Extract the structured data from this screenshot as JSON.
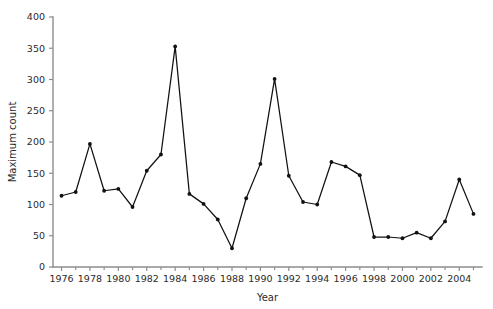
{
  "chart_data": {
    "type": "line",
    "title": "",
    "xlabel": "Year",
    "ylabel": "Maximum count",
    "xlim": [
      1975.4,
      2005.6
    ],
    "ylim": [
      0,
      400
    ],
    "grid": false,
    "legend": null,
    "x_tick_labels": [
      "1976",
      "1978",
      "1980",
      "1982",
      "1984",
      "1986",
      "1988",
      "1990",
      "1992",
      "1994",
      "1996",
      "1998",
      "2000",
      "2002",
      "2004"
    ],
    "x_tick_values": [
      1976,
      1978,
      1980,
      1982,
      1984,
      1986,
      1988,
      1990,
      1992,
      1994,
      1996,
      1998,
      2000,
      2002,
      2004
    ],
    "x_minor_tick_values": [
      1977,
      1979,
      1981,
      1983,
      1985,
      1987,
      1989,
      1991,
      1993,
      1995,
      1997,
      1999,
      2001,
      2003,
      2005
    ],
    "y_tick_labels": [
      "0",
      "50",
      "100",
      "150",
      "200",
      "250",
      "300",
      "350",
      "400"
    ],
    "y_tick_values": [
      0,
      50,
      100,
      150,
      200,
      250,
      300,
      350,
      400
    ],
    "x": [
      1976,
      1977,
      1978,
      1979,
      1980,
      1981,
      1982,
      1983,
      1984,
      1985,
      1986,
      1987,
      1988,
      1989,
      1990,
      1991,
      1992,
      1993,
      1994,
      1995,
      1996,
      1997,
      1998,
      1999,
      2000,
      2001,
      2002,
      2003,
      2004,
      2005
    ],
    "values": [
      114,
      120,
      197,
      122,
      125,
      96,
      154,
      180,
      353,
      117,
      101,
      76,
      30,
      110,
      165,
      301,
      146,
      104,
      100,
      168,
      161,
      147,
      48,
      48,
      46,
      55,
      46,
      73,
      140,
      85
    ],
    "series": [
      {
        "name": "Maximum count",
        "marker": "filled-circle",
        "color": "#111111",
        "values": [
          114,
          120,
          197,
          122,
          125,
          96,
          154,
          180,
          353,
          117,
          101,
          76,
          30,
          110,
          165,
          301,
          146,
          104,
          100,
          168,
          161,
          147,
          48,
          48,
          46,
          55,
          46,
          73,
          140,
          85
        ]
      }
    ]
  },
  "axes": {
    "x_title": "Year",
    "y_title": "Maximum count",
    "axis_color": "#8d8d8d",
    "line_color": "#111111"
  }
}
